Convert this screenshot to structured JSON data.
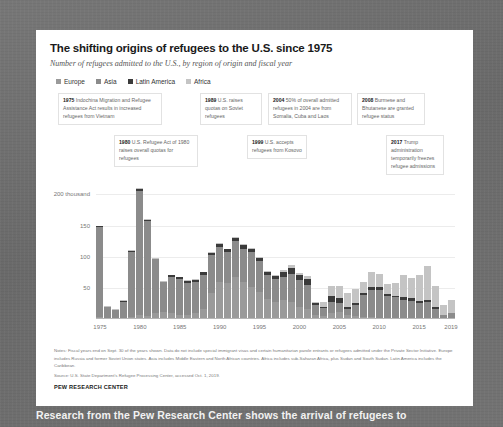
{
  "chart_data": {
    "type": "bar",
    "title": "The shifting origins of refugees to the U.S. since 1975",
    "subtitle": "Number of refugees admitted to the U.S., by region of origin and fiscal year",
    "xlabel": "",
    "ylabel": "",
    "ylim": [
      0,
      215
    ],
    "grid": true,
    "stacked": true,
    "legend_position": "top-left",
    "y_ticks": [
      "200 thousand",
      "150",
      "100",
      "50"
    ],
    "y_tick_values": [
      200,
      150,
      100,
      50
    ],
    "x_ticks": [
      "1975",
      "1980",
      "1985",
      "1990",
      "1995",
      "2000",
      "2005",
      "2010",
      "2015",
      "2019"
    ],
    "categories": [
      "1975",
      "1976",
      "1977",
      "1978",
      "1979",
      "1980",
      "1981",
      "1982",
      "1983",
      "1984",
      "1985",
      "1986",
      "1987",
      "1988",
      "1989",
      "1990",
      "1991",
      "1992",
      "1993",
      "1994",
      "1995",
      "1996",
      "1997",
      "1998",
      "1999",
      "2000",
      "2001",
      "2002",
      "2003",
      "2004",
      "2005",
      "2006",
      "2007",
      "2008",
      "2009",
      "2010",
      "2011",
      "2012",
      "2013",
      "2014",
      "2015",
      "2016",
      "2017",
      "2018",
      "2019"
    ],
    "series": [
      {
        "name": "Europe",
        "color": "#9a9a9a",
        "values": [
          4,
          2,
          1,
          2,
          4,
          6,
          5,
          10,
          12,
          10,
          7,
          7,
          9,
          16,
          42,
          60,
          58,
          68,
          60,
          52,
          44,
          32,
          28,
          30,
          27,
          20,
          16,
          6,
          5,
          10,
          11,
          6,
          5,
          3,
          3,
          2,
          1,
          1,
          0,
          0,
          1,
          2,
          2,
          1,
          1
        ]
      },
      {
        "name": "Asia",
        "color": "#8b8b8b",
        "values": [
          144,
          17,
          13,
          26,
          104,
          200,
          152,
          86,
          47,
          58,
          58,
          51,
          50,
          55,
          60,
          56,
          50,
          57,
          53,
          55,
          49,
          39,
          36,
          38,
          45,
          43,
          39,
          16,
          13,
          18,
          15,
          10,
          18,
          35,
          43,
          44,
          36,
          34,
          31,
          29,
          25,
          25,
          14,
          5,
          8
        ]
      },
      {
        "name": "Latin America",
        "color": "#3b3b3b",
        "values": [
          1,
          1,
          1,
          1,
          1,
          3,
          2,
          1,
          1,
          2,
          2,
          3,
          4,
          4,
          4,
          5,
          4,
          5,
          5,
          5,
          5,
          4,
          5,
          7,
          10,
          8,
          10,
          3,
          1,
          9,
          8,
          3,
          3,
          4,
          5,
          5,
          3,
          2,
          4,
          4,
          3,
          4,
          3,
          1,
          1
        ]
      },
      {
        "name": "Africa",
        "color": "#c4c4c4",
        "values": [
          1,
          1,
          1,
          1,
          1,
          2,
          2,
          1,
          1,
          1,
          1,
          1,
          1,
          1,
          1,
          1,
          1,
          2,
          2,
          2,
          2,
          2,
          2,
          3,
          4,
          3,
          4,
          2,
          9,
          16,
          19,
          22,
          22,
          18,
          24,
          22,
          16,
          21,
          35,
          33,
          41,
          54,
          34,
          15,
          20
        ]
      }
    ],
    "annotations": [
      {
        "year": "1975",
        "text": "Indochina Migration and Refugee Assistance Act results in increased refugees from Vietnam"
      },
      {
        "year": "1980",
        "text": "U.S. Refugee Act of 1980 raises overall quotas for refugees"
      },
      {
        "year": "1989",
        "text": "U.S. raises quotas on Soviet refugees"
      },
      {
        "year": "1999",
        "text": "U.S. accepts refugees from Kosovo"
      },
      {
        "year": "2004",
        "text": "50% of overall admitted refugees in 2004 are from Somalia, Cuba and Laos"
      },
      {
        "year": "2008",
        "text": "Burmese and Bhutanese are granted refugee status"
      },
      {
        "year": "2017",
        "text": "Trump administration temporarily freezes refugee admissions"
      }
    ],
    "notes": "Notes: Fiscal years end on Sept. 30 of the years shown. Data do not include special immigrant visas and certain humanitarian parole entrants or refugees admitted under the Private Sector Initiative. Europe includes Russia and former Soviet Union states. Asia includes Middle Eastern and North African countries. Africa includes sub-Saharan Africa, plus Sudan and South Sudan. Latin America includes the Caribbean.",
    "source": "Source: U.S. State Department's Refugee Processing Center, accessed Oct. 1, 2019.",
    "footer": "PEW RESEARCH CENTER"
  },
  "caption": "Research from the Pew Research Center shows the arrival of refugees to"
}
